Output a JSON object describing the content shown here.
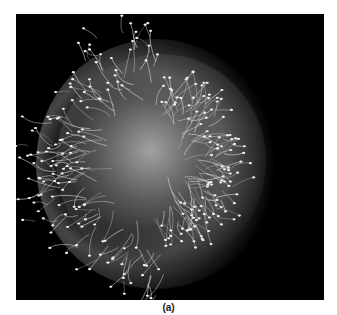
{
  "figure": {
    "caption": "(a)",
    "colors": {
      "background": "#000000",
      "highlight": "#e0e0e0",
      "page": "#ffffff"
    }
  }
}
